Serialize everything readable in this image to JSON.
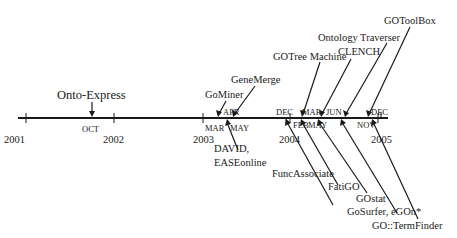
{
  "diagram": {
    "type": "timeline",
    "axis": {
      "years": [
        {
          "label": "2001",
          "x": 26
        },
        {
          "label": "2002",
          "x": 114
        },
        {
          "label": "2003",
          "x": 203
        },
        {
          "label": "2004",
          "x": 290
        },
        {
          "label": "2005",
          "x": 378
        }
      ]
    },
    "months": [
      {
        "label": "OCT",
        "x": 92,
        "pos": "below"
      },
      {
        "label": "MAR",
        "x": 218,
        "pos": "below"
      },
      {
        "label": "APR",
        "x": 225,
        "pos": "above"
      },
      {
        "label": "MAY",
        "x": 237,
        "pos": "below"
      },
      {
        "label": "DEC",
        "x": 285,
        "pos": "above"
      },
      {
        "label": "FEB",
        "x": 300,
        "pos": "below"
      },
      {
        "label": "MAR",
        "x": 305,
        "pos": "above"
      },
      {
        "label": "MAY",
        "x": 318,
        "pos": "below"
      },
      {
        "label": "JUN",
        "x": 328,
        "pos": "above"
      },
      {
        "label": "NOV",
        "x": 362,
        "pos": "below"
      },
      {
        "label": "DEC",
        "x": 372,
        "pos": "above"
      }
    ],
    "tools_above": [
      {
        "name": "Onto-Express",
        "date": "OCT 2001"
      },
      {
        "name": "GoMiner",
        "date": "MAR 2003"
      },
      {
        "name": "GeneMerge",
        "date": "APR 2003"
      },
      {
        "name": "GOTree Machine",
        "date": "MAR 2004"
      },
      {
        "name": "CLENCH",
        "date": "MAY 2004"
      },
      {
        "name": "Ontology Traverser",
        "date": "JUN 2004"
      },
      {
        "name": "GOToolBox",
        "date": "NOV 2004"
      }
    ],
    "tools_below": [
      {
        "name": "DAVID,",
        "name2": "EASEonline",
        "date": "MAY 2003"
      },
      {
        "name": "FuncAssociate",
        "date": "DEC 2003"
      },
      {
        "name": "FatiGO",
        "date": "FEB 2004"
      },
      {
        "name": "GOstat",
        "date": "MAY 2004"
      },
      {
        "name": "GoSurfer, eGOn*",
        "date": "JUN 2004"
      },
      {
        "name": "GO::TermFinder",
        "date": "DEC 2004"
      }
    ]
  }
}
